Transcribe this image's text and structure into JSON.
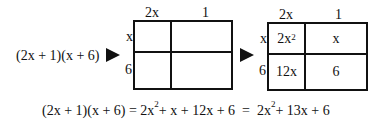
{
  "expression": "(2x + 1)(x + 6)",
  "grid_empty": {
    "col_labels": [
      "2x",
      "1"
    ],
    "row_labels": [
      "x",
      "6"
    ]
  },
  "grid_filled": {
    "col_labels": [
      "2x",
      "1"
    ],
    "row_labels": [
      "x",
      "6"
    ],
    "cells": [
      {
        "base": "2x",
        "exp": "2"
      },
      {
        "base": "x",
        "exp": ""
      },
      {
        "base": "12x",
        "exp": ""
      },
      {
        "base": "6",
        "exp": ""
      }
    ]
  },
  "equation": {
    "lhs": "(2x + 1)(x + 6) = ",
    "t1": "2x",
    "t1_exp": "2",
    "t2": "+ x + 12x + 6  =  ",
    "t3": "2x",
    "t3_exp": "2",
    "t4": "+ 13x + 6"
  }
}
